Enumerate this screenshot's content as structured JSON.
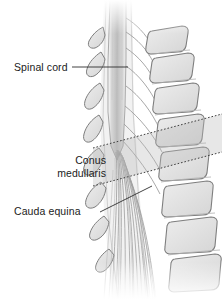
{
  "figure": {
    "style": "grayscale medical line illustration",
    "width": 222,
    "height": 299,
    "background": "#ffffff"
  },
  "labels": {
    "spinal_cord": "Spinal cord",
    "conus_line1": "Conus",
    "conus_line2": "medullaris",
    "cauda_equina": "Cauda equina"
  },
  "colors": {
    "text": "#1b1b1b",
    "leader_line": "#3a3a3a",
    "bone_fill": "#e3e3e3",
    "bone_fill_dark": "#d2d2d2",
    "bone_outline": "#8c8c8c",
    "cord_fill": "#cfcfcf",
    "nerve_stroke": "#9a9a9a",
    "band_fill": "#c9c9c9",
    "band_border": "#4a4a4a"
  },
  "anatomy": {
    "spinal_cord_label_target": "vertical cord band in spinal canal",
    "conus_band": "tilted dotted-outline highlight band over conus medullaris level",
    "cauda_equina_target": "fanned bundle of nerve filaments below conus"
  }
}
